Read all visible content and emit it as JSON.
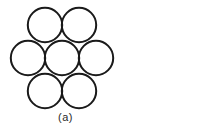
{
  "figure": {
    "caption": "(a)",
    "stroke_color": "#1a1a1a",
    "fill_color": "none",
    "background_color": "#ffffff",
    "stroke_width": 2,
    "circle_radius": 17.2,
    "circle_count": 7,
    "circles": [
      {
        "name": "top-left-circle",
        "cx": 45,
        "cy": 25
      },
      {
        "name": "top-right-circle",
        "cx": 79,
        "cy": 25
      },
      {
        "name": "middle-left-circle",
        "cx": 28,
        "cy": 58
      },
      {
        "name": "center-circle",
        "cx": 62,
        "cy": 58
      },
      {
        "name": "middle-right-circle",
        "cx": 96,
        "cy": 58
      },
      {
        "name": "bottom-left-circle",
        "cx": 45,
        "cy": 91
      },
      {
        "name": "bottom-right-circle",
        "cx": 79,
        "cy": 91
      }
    ]
  }
}
